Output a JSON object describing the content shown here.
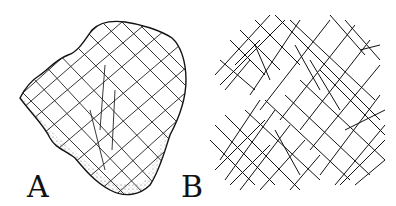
{
  "figure": {
    "panels": [
      {
        "label": "A",
        "description": "Drawing of an engraved stone plaquette with crosshatched incised lines"
      },
      {
        "label": "B",
        "description": "Tracing of the crosshatched engraved lines"
      }
    ]
  }
}
